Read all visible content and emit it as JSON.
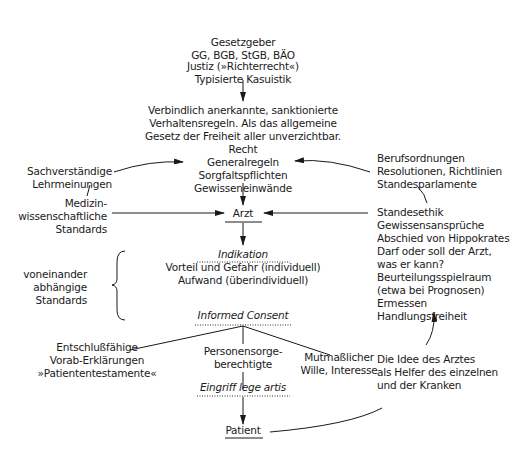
{
  "diagram": {
    "lawmaker": {
      "title": "Gesetzgeber",
      "laws": "GG, BGB, StGB, BÄO"
    },
    "justice": {
      "line1": "Justiz (»Richterrecht«)",
      "line2": "Typisierte Kasuistik"
    },
    "law_definition": {
      "line1": "Verbindlich anerkannte, sanktionierte",
      "line2": "Verhaltensregeln. Als das allgemeine",
      "line3": "Gesetz der Freiheit aller unverzichtbar."
    },
    "law": {
      "title": "Recht",
      "line1": "Generalregeln",
      "line2": "Sorgfaltspflichten",
      "line3": "Gewisseneinwände"
    },
    "expert_opinions": {
      "line1": "Sachverständige",
      "line2": "Lehrmeinungen"
    },
    "medical_standards": {
      "line1": "Medizin-",
      "line2": "wissenschaftliche",
      "line3": "Standards"
    },
    "professional_rules": {
      "line1": "Berufsordnungen",
      "line2": "Resolutionen, Richtlinien",
      "line3": "Standesparlamente"
    },
    "professional_ethics": {
      "lines": [
        "Standesethik",
        "Gewissensansprüche",
        "Abschied von Hippokrates",
        "Darf oder soll der Arzt,",
        "was er kann?",
        "Beurteilungsspielraum",
        "(etwa bei Prognosen)",
        "Ermessen",
        "Handlungsfreiheit"
      ]
    },
    "doctor": {
      "label": "Arzt"
    },
    "indication": {
      "title": "Indikation",
      "line1": "Vorteil und Gefahr (individuell)",
      "line2": "Aufwand (überindividuell)"
    },
    "interdependent_standards": {
      "line1": "voneinander",
      "line2": "abhängige",
      "line3": "Standards"
    },
    "informed_consent": {
      "title": "Informed Consent"
    },
    "advance_directives": {
      "line1": "Entschlußfähige",
      "line2": "Vorab-Erklärungen",
      "line3": "»Patiententestamente«"
    },
    "guardians": {
      "line1": "Personensorge-",
      "line2": "berechtigte"
    },
    "presumed_will": {
      "line1": "Mutmaßlicher",
      "line2": "Wille, Interesse"
    },
    "doctor_ideal": {
      "line1": "Die Idee des Arztes",
      "line2": "als Helfer des einzelnen",
      "line3": "und der Kranken"
    },
    "procedure": {
      "title": "Eingriff lege artis"
    },
    "patient": {
      "label": "Patient"
    },
    "colors": {
      "ink": "#1a1a1a",
      "background": "#ffffff"
    }
  }
}
